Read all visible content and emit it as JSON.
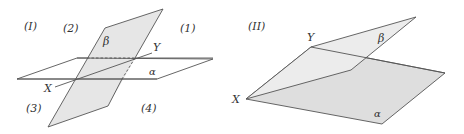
{
  "colors": {
    "background": "#ffffff",
    "line": "#555555",
    "plane_fill_beta": "#e6e6e6",
    "plane_fill_alpha_II": "#dedede",
    "plane_fill_beta_II": "#ececec",
    "text": "#333333"
  },
  "figure_I": {
    "label": "(I)",
    "plane_alpha_label": "α",
    "plane_beta_label": "β",
    "point_X": "X",
    "point_Y": "Y",
    "regions": {
      "r1": "(1)",
      "r2": "(2)",
      "r3": "(3)",
      "r4": "(4)"
    }
  },
  "figure_II": {
    "label": "(II)",
    "plane_alpha_label": "α",
    "plane_beta_label": "β",
    "point_X": "X",
    "point_Y": "Y"
  }
}
